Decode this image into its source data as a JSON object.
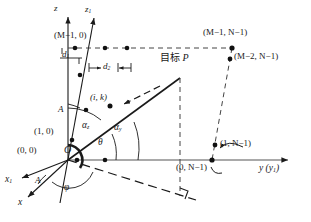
{
  "figure": {
    "axes": [
      {
        "id": "z",
        "label": "z",
        "x": 57,
        "y": 7,
        "type": "vertical-axis"
      },
      {
        "id": "z1",
        "label": "z",
        "sub": "1",
        "x": 88,
        "y": 8,
        "type": "tilted-axis"
      },
      {
        "id": "y",
        "label": "y (y",
        "sub": "1",
        "tail": ")",
        "x": 262,
        "y": 167,
        "type": "horizontal-axis"
      },
      {
        "id": "x",
        "label": "x",
        "x": 20,
        "y": 203,
        "type": "depth-axis"
      },
      {
        "id": "x1",
        "label": "x",
        "sub": "1",
        "x": 7,
        "y": 182,
        "type": "depth-axis-rotated"
      }
    ],
    "origin": {
      "label": "O",
      "x": 67,
      "y": 152
    },
    "element_labels": [
      {
        "id": "m-1-0",
        "text": "(M−1, 0)",
        "x": 58,
        "y": 36
      },
      {
        "id": "m-1-n-1",
        "text": "(M−1, N−1)",
        "x": 207,
        "y": 33
      },
      {
        "id": "m-2-n-1",
        "text": "(M−2, N−1)",
        "x": 230,
        "y": 56
      },
      {
        "id": "i-k",
        "text": "(i, k)",
        "x": 93,
        "y": 97
      },
      {
        "id": "one-zero",
        "text": "(1, 0)",
        "x": 38,
        "y": 131
      },
      {
        "id": "zero-zero",
        "text": "(0, 0)",
        "x": 21,
        "y": 151
      },
      {
        "id": "zero-n-1",
        "text": "(0, N−1)",
        "x": 180,
        "y": 165
      },
      {
        "id": "one-n-1",
        "text": "(1, N−1)",
        "x": 219,
        "y": 142
      }
    ],
    "target": {
      "text": "目标 P",
      "cjk": "目标",
      "italic": "P",
      "x": 163,
      "y": 57
    },
    "angle_labels": [
      {
        "id": "alpha-z",
        "base": "α",
        "sub": "z",
        "x": 85,
        "y": 125
      },
      {
        "id": "alpha-y",
        "base": "α",
        "sub": "y",
        "x": 117,
        "y": 127
      },
      {
        "id": "theta",
        "base": "θ",
        "sub": "",
        "x": 100,
        "y": 141
      },
      {
        "id": "phi",
        "base": "φ",
        "sub": "",
        "x": 66,
        "y": 186
      },
      {
        "id": "A-upper",
        "base": "A",
        "sub": "",
        "x": 60,
        "y": 109
      },
      {
        "id": "A-lower",
        "base": "A",
        "sub": "",
        "x": 37,
        "y": 180
      }
    ],
    "spacing_labels": [
      {
        "id": "d1",
        "base": "d",
        "sub": "1",
        "x": 65,
        "y": 54
      },
      {
        "id": "d2",
        "base": "d",
        "sub": "2",
        "x": 105,
        "y": 65
      }
    ],
    "colors": {
      "ink": "#1a1a1a",
      "line": "#333333",
      "dash": "#444444"
    }
  }
}
